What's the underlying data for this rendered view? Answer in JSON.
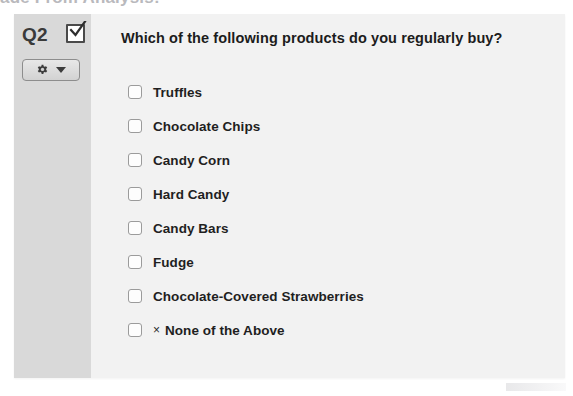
{
  "page": {
    "cropped_heading_text": "ade From Analysis:"
  },
  "question_card": {
    "gutter": {
      "question_number": "Q2",
      "question_type_icon": "checked-checkbox-icon",
      "settings_button": {
        "gear_icon": "gear-icon",
        "caret_icon": "chevron-down-icon"
      }
    },
    "title": "Which of the following products do you regularly buy?",
    "options": [
      {
        "label": "Truffles",
        "prefix": "",
        "checked": false
      },
      {
        "label": "Chocolate Chips",
        "prefix": "",
        "checked": false
      },
      {
        "label": "Candy Corn",
        "prefix": "",
        "checked": false
      },
      {
        "label": "Hard Candy",
        "prefix": "",
        "checked": false
      },
      {
        "label": "Candy Bars",
        "prefix": "",
        "checked": false
      },
      {
        "label": "Fudge",
        "prefix": "",
        "checked": false
      },
      {
        "label": "Chocolate-Covered Strawberries",
        "prefix": "",
        "checked": false
      },
      {
        "label": "None of the Above",
        "prefix": "×",
        "checked": false
      }
    ]
  },
  "colors": {
    "card_background": "#f2f2f2",
    "gutter_background": "#d9d9d9",
    "text_primary": "#1f1f1f",
    "checkbox_border": "#9b9b9b",
    "button_border": "#8d8d8d"
  }
}
